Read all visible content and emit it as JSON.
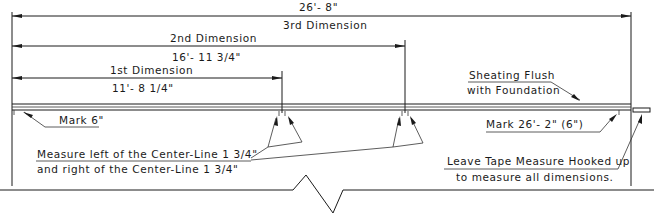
{
  "dimensions": {
    "third": {
      "value": "26'- 8\"",
      "label": "3rd Dimension"
    },
    "second": {
      "label": "2nd Dimension",
      "value": "16'- 11 3/4\""
    },
    "first": {
      "label": "1st Dimension",
      "value": "11'- 8 1/4\""
    }
  },
  "notes": {
    "sheathing": {
      "line1": "Sheating Flush",
      "line2": "with Foundation"
    },
    "mark_start": "Mark 6\"",
    "mark_end": "Mark 26'- 2\" (6\")",
    "measure": {
      "line1": "Measure left of the Center-Line 1 3/4\"",
      "line2": "and right of the Center-Line 1 3/4\""
    },
    "tape": {
      "line1": "Leave Tape Measure Hooked up",
      "line2": "to measure all dimensions."
    }
  },
  "colors": {
    "line": "#1a1a1a",
    "background": "#ffffff"
  }
}
